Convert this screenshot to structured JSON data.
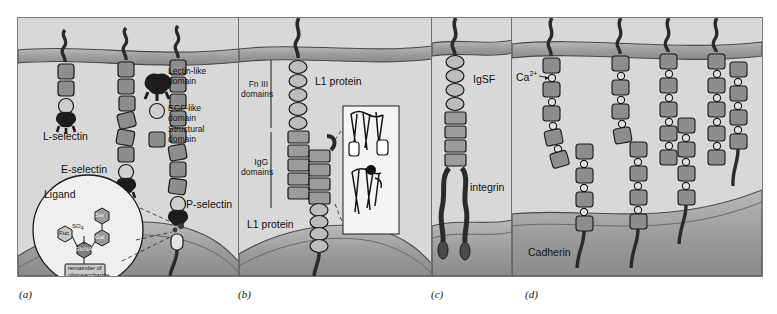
{
  "figure": {
    "background_color": "#d8d8d8",
    "membrane_color": "#9a9a9a",
    "domain_fill": "#8d8d8d",
    "outline_color": "#1a1a1a"
  },
  "panels": [
    {
      "id": "a",
      "label": "(a)",
      "topic": "Selectins",
      "molecules": [
        "L-selectin",
        "E-selectin",
        "P-selectin"
      ],
      "legend": [
        {
          "icon": "lectin-domain-icon",
          "label": "Lectin-like\ndomain"
        },
        {
          "icon": "egf-domain-icon",
          "label": "EGF-like\ndomain"
        },
        {
          "icon": "structural-domain-icon",
          "label": "Structural\ndomain"
        }
      ],
      "inset": {
        "title": "Ligand",
        "sugars": [
          "Sia",
          "Gal",
          "Fuc",
          "GlcNAc"
        ],
        "modification": "SO",
        "modification_sub": "4",
        "footer": "remainder of\noligosaccharide"
      }
    },
    {
      "id": "b",
      "label": "(b)",
      "topic": "Ig superfamily L1 protein",
      "brackets": [
        "Fn III\ndomains",
        "IgG\ndomains"
      ],
      "molecule_top": "L1 protein",
      "molecule_bottom": "L1 protein",
      "inset_caption": "ribbon-structure-inset"
    },
    {
      "id": "c",
      "label": "(c)",
      "topic": "IgSF–integrin pairing",
      "molecules": [
        "IgSF",
        "integrin"
      ]
    },
    {
      "id": "d",
      "label": "(d)",
      "topic": "Cadherins",
      "molecules": [
        "Cadherin"
      ],
      "ion": "Ca",
      "ion_charge": "2+"
    }
  ]
}
